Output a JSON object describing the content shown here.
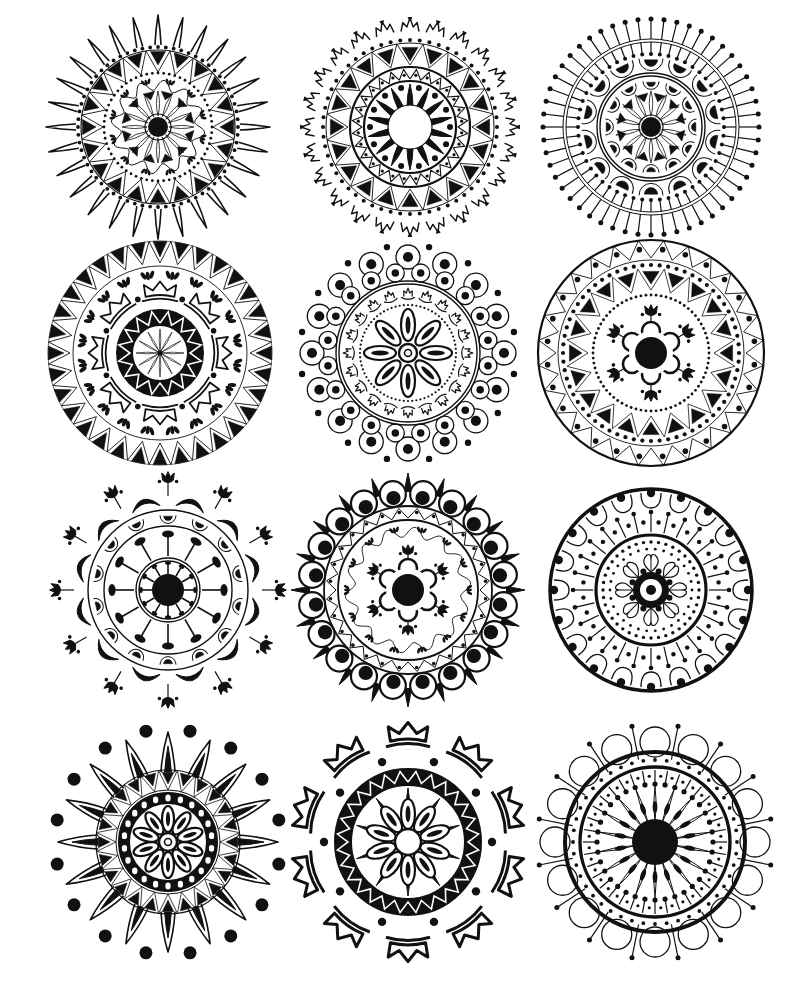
{
  "page": {
    "width": 810,
    "height": 985,
    "background": "#ffffff",
    "ink": "#111111"
  },
  "layout": {
    "columns": 3,
    "rows": 4
  },
  "mandalas": [
    {
      "id": "m1",
      "name": "sunburst-pointed-petals",
      "cx": 158,
      "cy": 127,
      "r": 112,
      "rings": [
        {
          "type": "spikes",
          "n": 28,
          "r1": 82,
          "r2": 112,
          "w": 0.11,
          "fill": false,
          "sw": 1.6
        },
        {
          "type": "dots",
          "n": 64,
          "r": 80,
          "size": 1.9
        },
        {
          "type": "circle",
          "r": 77,
          "sw": 1.2
        },
        {
          "type": "triangles",
          "n": 20,
          "r1": 62,
          "r2": 76,
          "fill": true,
          "outward": false
        },
        {
          "type": "zigzag",
          "n": 20,
          "r1": 55,
          "r2": 77,
          "sw": 0.9
        },
        {
          "type": "dots",
          "n": 60,
          "r": 54,
          "size": 1.4
        },
        {
          "type": "wave",
          "n": 12,
          "r": 42,
          "amp": 5,
          "sw": 1
        },
        {
          "type": "fans",
          "n": 12,
          "r": 46,
          "size": 5
        },
        {
          "type": "triangles",
          "n": 12,
          "r1": 28,
          "r2": 36,
          "fill": true,
          "outward": false,
          "offset": 0.5
        },
        {
          "type": "petals",
          "n": 16,
          "r1": 11,
          "r2": 36,
          "w": 0.22,
          "fill": false,
          "sw": 0.8
        },
        {
          "type": "circle",
          "r": 13,
          "sw": 1.2
        },
        {
          "type": "disc",
          "r": 10
        }
      ]
    },
    {
      "id": "m2",
      "name": "crown-rim-star-center",
      "cx": 410,
      "cy": 127,
      "r": 110,
      "rings": [
        {
          "type": "crowns",
          "n": 24,
          "r": 100,
          "size": 9
        },
        {
          "type": "dots",
          "n": 56,
          "r": 87,
          "size": 2
        },
        {
          "type": "circle",
          "r": 84,
          "sw": 1
        },
        {
          "type": "triangles",
          "n": 20,
          "r1": 66,
          "r2": 80,
          "fill": true,
          "outward": false
        },
        {
          "type": "zigzag",
          "n": 20,
          "r1": 62,
          "r2": 84,
          "sw": 0.9
        },
        {
          "type": "circle",
          "r": 60,
          "sw": 2.2
        },
        {
          "type": "zigzag",
          "n": 28,
          "r1": 48,
          "r2": 58,
          "sw": 1.1
        },
        {
          "type": "dots",
          "n": 28,
          "r": 52,
          "size": 1.6,
          "offset": 0.5
        },
        {
          "type": "circle",
          "r": 46,
          "sw": 2.2
        },
        {
          "type": "dots",
          "n": 14,
          "r": 40,
          "size": 3,
          "offset": 0.5
        },
        {
          "type": "spikes",
          "n": 14,
          "r1": 22,
          "r2": 43,
          "w": 0.2,
          "fill": true
        },
        {
          "type": "circle",
          "r": 22,
          "sw": 1.2
        }
      ]
    },
    {
      "id": "m3",
      "name": "pin-rim-scallop",
      "cx": 651,
      "cy": 127,
      "r": 112,
      "rings": [
        {
          "type": "pins",
          "n": 52,
          "r1": 88,
          "r2": 108,
          "size": 2.5
        },
        {
          "type": "circle",
          "r": 88,
          "sw": 1
        },
        {
          "type": "circle",
          "r": 85,
          "sw": 1
        },
        {
          "type": "pins",
          "n": 52,
          "r1": 85,
          "r2": 73,
          "size": 2
        },
        {
          "type": "scallops",
          "n": 14,
          "r": 66,
          "size": 12,
          "half": true
        },
        {
          "type": "circle",
          "r": 54,
          "sw": 1.4
        },
        {
          "type": "circle",
          "r": 51,
          "sw": 1.4
        },
        {
          "type": "scallops",
          "n": 12,
          "r": 44,
          "size": 8,
          "half": true
        },
        {
          "type": "triangles",
          "n": 12,
          "r1": 26,
          "r2": 34,
          "fill": true,
          "outward": false,
          "offset": 0.5
        },
        {
          "type": "petals",
          "n": 14,
          "r1": 11,
          "r2": 36,
          "w": 0.22,
          "fill": false,
          "sw": 0.8
        },
        {
          "type": "circle",
          "r": 12,
          "sw": 1.2
        },
        {
          "type": "disc",
          "r": 10
        }
      ]
    },
    {
      "id": "m4",
      "name": "triangle-rim-lotus",
      "cx": 160,
      "cy": 353,
      "r": 113,
      "rings": [
        {
          "type": "triangles",
          "n": 32,
          "r1": 96,
          "r2": 112,
          "fill": true,
          "outward": false
        },
        {
          "type": "zigzag",
          "n": 32,
          "r1": 90,
          "r2": 112,
          "sw": 0.9
        },
        {
          "type": "circle",
          "r": 112,
          "sw": 0.6
        },
        {
          "type": "circle",
          "r": 87,
          "sw": 0.9
        },
        {
          "type": "fans",
          "n": 20,
          "r": 78,
          "size": 7
        },
        {
          "type": "lotus",
          "n": 8,
          "r": 58,
          "size": 18
        },
        {
          "type": "dots",
          "n": 8,
          "r": 58,
          "size": 2.8,
          "offset": 0.5
        },
        {
          "type": "ring",
          "r1": 27,
          "r2": 44
        },
        {
          "type": "zigzag-white",
          "n": 16,
          "r1": 30,
          "r2": 42,
          "sw": 1.6
        },
        {
          "type": "petals",
          "n": 12,
          "r1": 2,
          "r2": 24,
          "w": 0.16,
          "fill": false,
          "sw": 0.7
        },
        {
          "type": "disc",
          "r": 2.5
        }
      ]
    },
    {
      "id": "m5",
      "name": "bubble-rim-daisy",
      "cx": 408,
      "cy": 353,
      "r": 113,
      "rings": [
        {
          "type": "dots",
          "n": 16,
          "r": 108,
          "size": 3.2,
          "offset": 0.5
        },
        {
          "type": "bubbles",
          "n": 16,
          "r": 96,
          "size": 12
        },
        {
          "type": "bubbles",
          "n": 20,
          "r": 81,
          "size": 9,
          "offset": 0.5
        },
        {
          "type": "circle",
          "r": 72,
          "sw": 1.4
        },
        {
          "type": "circle",
          "r": 69,
          "sw": 1.4
        },
        {
          "type": "crowns-in",
          "n": 20,
          "r": 60,
          "size": 7
        },
        {
          "type": "dots",
          "n": 72,
          "r": 48,
          "size": 1.1
        },
        {
          "type": "ovals",
          "n": 8,
          "r": 28,
          "len": 16,
          "wid": 7
        },
        {
          "type": "circle",
          "r": 9,
          "sw": 2.4
        },
        {
          "type": "circle",
          "r": 3.5,
          "sw": 1.6
        }
      ]
    },
    {
      "id": "m6",
      "name": "bordered-tulip-star",
      "cx": 651,
      "cy": 353,
      "r": 115,
      "rings": [
        {
          "type": "circle",
          "r": 113,
          "sw": 2.2
        },
        {
          "type": "zigzag",
          "n": 28,
          "r1": 95,
          "r2": 113,
          "sw": 0.9
        },
        {
          "type": "dots",
          "n": 28,
          "r": 104,
          "size": 2.8,
          "offset": 0.5
        },
        {
          "type": "circle",
          "r": 93,
          "sw": 0.9
        },
        {
          "type": "dots",
          "n": 64,
          "r": 88,
          "size": 2.1
        },
        {
          "type": "triangles",
          "n": 20,
          "r1": 69,
          "r2": 82,
          "fill": true,
          "outward": false
        },
        {
          "type": "zigzag",
          "n": 20,
          "r1": 63,
          "r2": 85,
          "sw": 0.8
        },
        {
          "type": "dots",
          "n": 72,
          "r": 58,
          "size": 1.4
        },
        {
          "type": "tulips",
          "n": 6,
          "r": 38,
          "size": 9
        },
        {
          "type": "flower",
          "n": 6,
          "r": 22,
          "size": 9
        },
        {
          "type": "disc",
          "r": 16
        }
      ]
    },
    {
      "id": "m7",
      "name": "tulip-spokes-wheel",
      "cx": 168,
      "cy": 590,
      "r": 118,
      "rings": [
        {
          "type": "tulips",
          "n": 12,
          "r": 108,
          "size": 9,
          "stem": 14
        },
        {
          "type": "arcs-black",
          "n": 12,
          "r": 88,
          "size": 14,
          "offset": 0.5
        },
        {
          "type": "circle",
          "r": 80,
          "sw": 1.4
        },
        {
          "type": "scallops",
          "n": 14,
          "r": 73,
          "size": 8,
          "half": true
        },
        {
          "type": "circle",
          "r": 64,
          "sw": 1.4
        },
        {
          "type": "mallets",
          "n": 12,
          "r1": 34,
          "r2": 56,
          "size": 6
        },
        {
          "type": "circle",
          "r": 32,
          "sw": 1.4
        },
        {
          "type": "circle",
          "r": 29,
          "sw": 1.4
        },
        {
          "type": "mallets",
          "n": 12,
          "r1": 16,
          "r2": 27,
          "size": 3
        },
        {
          "type": "disc",
          "r": 16
        }
      ]
    },
    {
      "id": "m8",
      "name": "spiked-scallop-flower",
      "cx": 408,
      "cy": 590,
      "r": 118,
      "rings": [
        {
          "type": "spikes",
          "n": 20,
          "r1": 98,
          "r2": 117,
          "w": 0.07,
          "fill": true
        },
        {
          "type": "bubbles-black",
          "n": 20,
          "r": 97,
          "size": 13,
          "offset": 0.5
        },
        {
          "type": "circle",
          "r": 84,
          "sw": 1.8
        },
        {
          "type": "zigzag",
          "n": 28,
          "r1": 72,
          "r2": 82,
          "sw": 1
        },
        {
          "type": "dots",
          "n": 28,
          "r": 78,
          "size": 1.8,
          "offset": 0.5
        },
        {
          "type": "circle",
          "r": 70,
          "sw": 1.8
        },
        {
          "type": "wave",
          "n": 14,
          "r": 58,
          "amp": 5,
          "sw": 0.9
        },
        {
          "type": "fans",
          "n": 14,
          "r": 61,
          "size": 5
        },
        {
          "type": "tulips",
          "n": 6,
          "r": 36,
          "size": 8
        },
        {
          "type": "flower",
          "n": 6,
          "r": 22,
          "size": 9
        },
        {
          "type": "disc",
          "r": 16
        }
      ]
    },
    {
      "id": "m9",
      "name": "arch-ring-dotted-flower",
      "cx": 651,
      "cy": 590,
      "r": 103,
      "rings": [
        {
          "type": "circle",
          "r": 101,
          "sw": 3.5
        },
        {
          "type": "arches",
          "n": 20,
          "r": 88,
          "size": 10
        },
        {
          "type": "pins",
          "n": 28,
          "r1": 58,
          "r2": 78,
          "size": 2.3
        },
        {
          "type": "dots",
          "n": 28,
          "r": 68,
          "size": 2.2,
          "offset": 0.5
        },
        {
          "type": "circle",
          "r": 55,
          "sw": 3.2
        },
        {
          "type": "dots",
          "n": 40,
          "r": 48,
          "size": 1.7
        },
        {
          "type": "dots",
          "n": 30,
          "r": 41,
          "size": 1.4,
          "offset": 0.5
        },
        {
          "type": "loops",
          "n": 8,
          "r": 26,
          "size": 10
        },
        {
          "type": "dots",
          "n": 8,
          "r": 20,
          "size": 3,
          "offset": 0.5
        },
        {
          "type": "ring",
          "r1": 11,
          "r2": 18
        },
        {
          "type": "disc",
          "r": 5
        }
      ]
    },
    {
      "id": "m10",
      "name": "dot-halo-star-daisy",
      "cx": 168,
      "cy": 842,
      "r": 123,
      "rings": [
        {
          "type": "dots",
          "n": 16,
          "r": 113,
          "size": 6.5,
          "offset": 0.5
        },
        {
          "type": "spikes",
          "n": 16,
          "r1": 70,
          "r2": 110,
          "w": 0.17,
          "fill": false,
          "sw": 1.6
        },
        {
          "type": "spikes",
          "n": 16,
          "r1": 70,
          "r2": 96,
          "w": 0.08,
          "fill": true
        },
        {
          "type": "circle",
          "r": 72,
          "sw": 1.2
        },
        {
          "type": "triangles",
          "n": 24,
          "r1": 58,
          "r2": 70,
          "fill": true,
          "outward": false
        },
        {
          "type": "zigzag",
          "n": 24,
          "r1": 52,
          "r2": 72,
          "sw": 0.8
        },
        {
          "type": "circle",
          "r": 52,
          "sw": 1
        },
        {
          "type": "ring",
          "r1": 38,
          "r2": 50
        },
        {
          "type": "holes",
          "n": 22,
          "r": 44,
          "size": 2.6
        },
        {
          "type": "ovals",
          "n": 10,
          "r": 23,
          "len": 13,
          "wid": 6
        },
        {
          "type": "circle",
          "r": 9,
          "sw": 2.4
        },
        {
          "type": "circle",
          "r": 3.5,
          "sw": 1.6
        }
      ]
    },
    {
      "id": "m11",
      "name": "lotus-crown-bold",
      "cx": 408,
      "cy": 842,
      "r": 122,
      "rings": [
        {
          "type": "lotus",
          "n": 10,
          "r": 103,
          "size": 22,
          "bold": true
        },
        {
          "type": "dots",
          "n": 10,
          "r": 84,
          "size": 4.2,
          "offset": 0.5
        },
        {
          "type": "ring",
          "r1": 56,
          "r2": 74
        },
        {
          "type": "zigzag-white",
          "n": 28,
          "r1": 60,
          "r2": 71,
          "sw": 1.6
        },
        {
          "type": "spikes",
          "n": 10,
          "r1": 34,
          "r2": 54,
          "w": 0.06,
          "fill": true
        },
        {
          "type": "ovals",
          "n": 10,
          "r": 28,
          "len": 15,
          "wid": 7,
          "inner": true
        },
        {
          "type": "circle",
          "r": 13,
          "sw": 2.4
        }
      ]
    },
    {
      "id": "m12",
      "name": "loop-rim-sunflower",
      "cx": 655,
      "cy": 842,
      "r": 117,
      "rings": [
        {
          "type": "bubbles",
          "n": 16,
          "r": 100,
          "size": 15,
          "plain": true
        },
        {
          "type": "pins",
          "n": 16,
          "r1": 84,
          "r2": 118,
          "size": 2.5,
          "offset": 0.5
        },
        {
          "type": "circle",
          "r": 90,
          "sw": 4
        },
        {
          "type": "dots",
          "n": 44,
          "r": 82,
          "size": 1.9
        },
        {
          "type": "circle",
          "r": 75,
          "sw": 3.4
        },
        {
          "type": "pins",
          "n": 36,
          "r1": 72,
          "r2": 58,
          "size": 2.6
        },
        {
          "type": "dots",
          "n": 36,
          "r": 66,
          "size": 1.6,
          "offset": 0.5
        },
        {
          "type": "petals",
          "n": 18,
          "r1": 20,
          "r2": 56,
          "w": 0.13,
          "fill": false,
          "sw": 1
        },
        {
          "type": "seeds",
          "n": 18,
          "r": 35,
          "len": 6,
          "wid": 2.4
        },
        {
          "type": "disc",
          "r": 23
        }
      ]
    }
  ]
}
